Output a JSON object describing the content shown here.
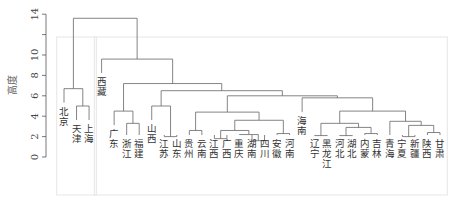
{
  "chart_data": {
    "type": "dendrogram",
    "title": "",
    "xlabel": "",
    "ylabel": "高度",
    "ylim": [
      0,
      14
    ],
    "y_ticks": [
      0,
      2,
      4,
      6,
      8,
      10,
      12,
      14
    ],
    "y_tick_labels": [
      "0",
      "2",
      "4",
      "6",
      "8",
      "10",
      "",
      "14"
    ],
    "leaves": [
      "北京",
      "天津",
      "上海",
      "西藏",
      "广东",
      "浙江",
      "福建",
      "山西",
      "江苏",
      "山东",
      "贵州",
      "云南",
      "江西",
      "广西",
      "重庆",
      "湖南",
      "四川",
      "安徽",
      "河南",
      "海南",
      "辽宁",
      "黑龙江",
      "河北",
      "湖北",
      "内蒙",
      "吉林",
      "青海",
      "宁夏",
      "新疆",
      "陕西",
      "甘肃"
    ],
    "merges": [
      {
        "a": "L1",
        "b": "L2",
        "height": 5.0,
        "id": "m1"
      },
      {
        "a": "L0",
        "b": "m1",
        "height": 6.7,
        "id": "m2"
      },
      {
        "a": "L5",
        "b": "L6",
        "height": 3.3,
        "id": "m3"
      },
      {
        "a": "L4",
        "b": "m3",
        "height": 4.5,
        "id": "m4"
      },
      {
        "a": "L8",
        "b": "L9",
        "height": 2.0,
        "id": "m5"
      },
      {
        "a": "L7",
        "b": "m5",
        "height": 5.0,
        "id": "m6"
      },
      {
        "a": "L10",
        "b": "L11",
        "height": 2.6,
        "id": "m7"
      },
      {
        "a": "L12",
        "b": "L13",
        "height": 1.8,
        "id": "m8"
      },
      {
        "a": "L15",
        "b": "L16",
        "height": 1.6,
        "id": "m9"
      },
      {
        "a": "L14",
        "b": "m9",
        "height": 2.2,
        "id": "m10"
      },
      {
        "a": "m8",
        "b": "m10",
        "height": 2.6,
        "id": "m11"
      },
      {
        "a": "L17",
        "b": "L18",
        "height": 2.3,
        "id": "m12"
      },
      {
        "a": "m11",
        "b": "m12",
        "height": 3.6,
        "id": "m13"
      },
      {
        "a": "m7",
        "b": "m13",
        "height": 4.4,
        "id": "m14"
      },
      {
        "a": "L20",
        "b": "L21",
        "height": 2.1,
        "id": "m15"
      },
      {
        "a": "L22",
        "b": "L23",
        "height": 2.1,
        "id": "m16"
      },
      {
        "a": "L24",
        "b": "L25",
        "height": 2.3,
        "id": "m17"
      },
      {
        "a": "m16",
        "b": "m17",
        "height": 2.9,
        "id": "m18"
      },
      {
        "a": "m15",
        "b": "m18",
        "height": 3.3,
        "id": "m19"
      },
      {
        "a": "L27",
        "b": "L28",
        "height": 2.0,
        "id": "m20"
      },
      {
        "a": "L29",
        "b": "L30",
        "height": 2.4,
        "id": "m21"
      },
      {
        "a": "m20",
        "b": "m21",
        "height": 3.1,
        "id": "m22"
      },
      {
        "a": "L26",
        "b": "m22",
        "height": 3.5,
        "id": "m23"
      },
      {
        "a": "m19",
        "b": "m23",
        "height": 4.5,
        "id": "m24"
      },
      {
        "a": "L19",
        "b": "m24",
        "height": 5.8,
        "id": "m25"
      },
      {
        "a": "m14",
        "b": "m25",
        "height": 6.0,
        "id": "m26"
      },
      {
        "a": "m6",
        "b": "m26",
        "height": 6.5,
        "id": "m27"
      },
      {
        "a": "m4",
        "b": "m27",
        "height": 7.2,
        "id": "m28"
      },
      {
        "a": "L3",
        "b": "m28",
        "height": 9.6,
        "id": "m29"
      },
      {
        "a": "m2",
        "b": "m29",
        "height": 13.6,
        "id": "m30"
      }
    ],
    "cluster_boxes": [
      {
        "from_leaf": 0,
        "to_leaf": 2
      },
      {
        "from_leaf": 3,
        "to_leaf": 30
      }
    ],
    "grid": false,
    "legend": "none"
  }
}
